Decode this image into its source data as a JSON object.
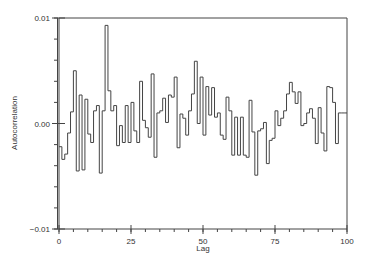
{
  "chart_data": {
    "type": "line",
    "style": "step",
    "title": "",
    "xlabel": "Lag",
    "ylabel": "Autocorrelation",
    "xlim": [
      0,
      100
    ],
    "ylim": [
      -0.01,
      0.01
    ],
    "grid": false,
    "legend": null,
    "x_ticks": [
      0,
      25,
      50,
      75,
      100
    ],
    "x_tick_labels": [
      "0",
      "25",
      "50",
      "75",
      "100"
    ],
    "x_minor_step": 5,
    "y_ticks": [
      -0.01,
      0.0,
      0.01
    ],
    "y_tick_labels": [
      "−0.01",
      "0.00",
      "0.01"
    ],
    "y_minor_step": 0.002,
    "series": [
      {
        "name": "Autocorrelation",
        "color": "#444444",
        "x": [
          0,
          1,
          2,
          3,
          4,
          5,
          6,
          7,
          8,
          9,
          10,
          11,
          12,
          13,
          14,
          15,
          16,
          17,
          18,
          19,
          20,
          21,
          22,
          23,
          24,
          25,
          26,
          27,
          28,
          29,
          30,
          31,
          32,
          33,
          34,
          35,
          36,
          37,
          38,
          39,
          40,
          41,
          42,
          43,
          44,
          45,
          46,
          47,
          48,
          49,
          50,
          51,
          52,
          53,
          54,
          55,
          56,
          57,
          58,
          59,
          60,
          61,
          62,
          63,
          64,
          65,
          66,
          67,
          68,
          69,
          70,
          71,
          72,
          73,
          74,
          75,
          76,
          77,
          78,
          79,
          80,
          81,
          82,
          83,
          84,
          85,
          86,
          87,
          88,
          89,
          90,
          91,
          92,
          93,
          94,
          95,
          96,
          97,
          98,
          99
        ],
        "values": [
          -0.0022,
          -0.0034,
          -0.0029,
          -0.0009,
          0.0011,
          0.005,
          -0.0045,
          0.0027,
          -0.0044,
          0.0023,
          -0.001,
          -0.0018,
          0.0012,
          0.0017,
          -0.0047,
          0.0012,
          0.0093,
          0.0031,
          0.0012,
          0.0017,
          -0.0021,
          -0.0002,
          -0.0018,
          0.0017,
          -0.0018,
          0.002,
          -0.0007,
          -0.0018,
          0.004,
          0.0003,
          -0.0004,
          -0.0013,
          0.0047,
          -0.0032,
          0.001,
          0.0012,
          0.0024,
          0.0001,
          0.0027,
          0.0025,
          0.0044,
          -0.0023,
          0.0009,
          0.0005,
          -0.0011,
          0.0012,
          0.0028,
          0.0059,
          0.0,
          0.0044,
          -0.0011,
          0.0035,
          0.0008,
          0.0034,
          0.0006,
          0.001,
          -0.0011,
          -0.0015,
          0.0025,
          0.0012,
          -0.003,
          0.0006,
          -0.003,
          0.0006,
          -0.003,
          -0.0032,
          0.0022,
          -0.0008,
          -0.0049,
          -0.0007,
          -0.0005,
          0.0001,
          -0.0038,
          -0.0016,
          -0.0014,
          0.0012,
          -0.0002,
          0.0005,
          0.0012,
          0.0028,
          0.0039,
          0.003,
          0.0019,
          0.003,
          -0.0002,
          0.0,
          0.001,
          0.0014,
          0.0005,
          -0.0019,
          0.0015,
          -0.0009,
          -0.0026,
          0.0035,
          0.0034,
          0.002,
          -0.0019,
          0.001,
          0.001,
          0.001
        ]
      }
    ]
  }
}
